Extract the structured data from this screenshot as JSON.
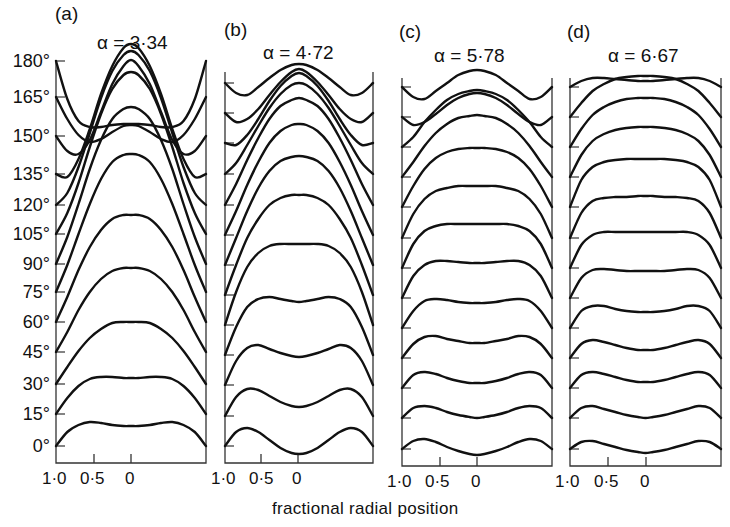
{
  "chart_data": {
    "type": "line",
    "title": "",
    "xlabel": "fractional radial position",
    "ylabel": "",
    "y_tick_labels": [
      "180°",
      "165°",
      "150°",
      "135°",
      "120°",
      "105°",
      "90°",
      "75°",
      "60°",
      "45°",
      "30°",
      "15°",
      "0°"
    ],
    "x_tick_labels": [
      "1·0",
      "0·5",
      "0"
    ],
    "grid": false,
    "legend": null,
    "panels": [
      {
        "letter": "(a)",
        "alpha_label": "α = 3·34",
        "alpha": 3.34,
        "x0": 56,
        "x1": 206,
        "top": 60,
        "bottom": 463,
        "xc": 131,
        "xh": 94,
        "baselines": [
          446,
          414,
          384,
          352,
          322,
          292,
          264,
          234,
          205,
          174,
          136,
          97,
          61
        ],
        "samples_x": [
          -1,
          -0.85,
          -0.7,
          -0.55,
          -0.4,
          -0.25,
          -0.1,
          0,
          0.1,
          0.25,
          0.4,
          0.55,
          0.7,
          0.85,
          1
        ],
        "curves": [
          [
            0,
            -14,
            -21,
            -24,
            -23,
            -21,
            -20,
            -20,
            -20,
            -21,
            -23,
            -24,
            -21,
            -14,
            0
          ],
          [
            0,
            -16,
            -28,
            -35,
            -37,
            -37,
            -36,
            -36,
            -36,
            -37,
            -37,
            -35,
            -28,
            -16,
            0
          ],
          [
            0,
            -17,
            -33,
            -46,
            -55,
            -61,
            -62,
            -62,
            -62,
            -61,
            -55,
            -46,
            -33,
            -17,
            0
          ],
          [
            0,
            -20,
            -42,
            -60,
            -73,
            -81,
            -84,
            -84,
            -84,
            -81,
            -73,
            -60,
            -42,
            -20,
            0
          ],
          [
            0,
            -25,
            -52,
            -75,
            -92,
            -103,
            -107,
            -107,
            -107,
            -103,
            -92,
            -75,
            -52,
            -25,
            0
          ],
          [
            0,
            -27,
            -58,
            -88,
            -113,
            -130,
            -137,
            -138,
            -137,
            -130,
            -113,
            -88,
            -58,
            -27,
            0
          ],
          [
            0,
            -27,
            -60,
            -95,
            -124,
            -145,
            -155,
            -157,
            -155,
            -145,
            -124,
            -95,
            -60,
            -27,
            0
          ],
          [
            0,
            -21,
            -51,
            -87,
            -120,
            -145,
            -159,
            -162,
            -159,
            -145,
            -120,
            -87,
            -51,
            -21,
            0
          ],
          [
            0,
            -12,
            -38,
            -72,
            -107,
            -134,
            -150,
            -154,
            -150,
            -134,
            -107,
            -72,
            -38,
            -12,
            0
          ],
          [
            0,
            3,
            -15,
            -45,
            -80,
            -108,
            -126,
            -130,
            -126,
            -108,
            -80,
            -45,
            -15,
            3,
            0
          ],
          [
            0,
            15,
            18,
            4,
            -24,
            -52,
            -70,
            -76,
            -70,
            -52,
            -24,
            4,
            18,
            15,
            0
          ],
          [
            0,
            22,
            38,
            45,
            42,
            35,
            29,
            28,
            29,
            35,
            42,
            45,
            38,
            22,
            0
          ],
          [
            0,
            38,
            60,
            66,
            66,
            64,
            63,
            63,
            63,
            64,
            66,
            66,
            60,
            38,
            0
          ]
        ]
      },
      {
        "letter": "(b)",
        "alpha_label": "α = 4·72",
        "alpha": 4.72,
        "x0": 225,
        "x1": 373,
        "top": 72,
        "bottom": 463,
        "xc": 298,
        "xh": 261,
        "baselines": [
          446,
          416,
          385,
          355,
          325,
          295,
          265,
          235,
          205,
          174,
          143,
          113,
          83
        ],
        "samples_x": [
          -1,
          -0.85,
          -0.7,
          -0.55,
          -0.4,
          -0.25,
          -0.1,
          0,
          0.1,
          0.25,
          0.4,
          0.55,
          0.7,
          0.85,
          1
        ],
        "curves": [
          [
            0,
            -14,
            -18,
            -14,
            -6,
            2,
            7,
            8,
            7,
            2,
            -6,
            -14,
            -18,
            -14,
            0
          ],
          [
            0,
            -19,
            -27,
            -26,
            -20,
            -14,
            -10,
            -9,
            -10,
            -14,
            -20,
            -26,
            -27,
            -19,
            0
          ],
          [
            0,
            -24,
            -37,
            -40,
            -36,
            -32,
            -29,
            -28,
            -29,
            -32,
            -36,
            -40,
            -37,
            -24,
            0
          ],
          [
            0,
            -28,
            -48,
            -56,
            -58,
            -56,
            -54,
            -53,
            -54,
            -56,
            -58,
            -56,
            -48,
            -28,
            0
          ],
          [
            0,
            -33,
            -58,
            -72,
            -79,
            -81,
            -81,
            -81,
            -81,
            -81,
            -79,
            -72,
            -58,
            -33,
            0
          ],
          [
            0,
            -30,
            -57,
            -76,
            -90,
            -97,
            -100,
            -100,
            -100,
            -97,
            -90,
            -76,
            -57,
            -30,
            0
          ],
          [
            0,
            -27,
            -54,
            -77,
            -94,
            -104,
            -108,
            -109,
            -108,
            -104,
            -94,
            -77,
            -54,
            -27,
            0
          ],
          [
            0,
            -24,
            -50,
            -73,
            -92,
            -104,
            -110,
            -111,
            -110,
            -104,
            -92,
            -73,
            -50,
            -24,
            0
          ],
          [
            0,
            -21,
            -45,
            -67,
            -86,
            -99,
            -105,
            -107,
            -105,
            -99,
            -86,
            -67,
            -45,
            -21,
            0
          ],
          [
            0,
            -11,
            -29,
            -48,
            -66,
            -80,
            -89,
            -91,
            -89,
            -80,
            -66,
            -48,
            -29,
            -11,
            0
          ],
          [
            0,
            2,
            -8,
            -24,
            -42,
            -57,
            -67,
            -70,
            -67,
            -57,
            -42,
            -24,
            -8,
            2,
            0
          ],
          [
            0,
            9,
            6,
            -4,
            -18,
            -31,
            -41,
            -44,
            -41,
            -31,
            -18,
            -4,
            6,
            9,
            0
          ],
          [
            0,
            10,
            12,
            4,
            -5,
            -13,
            -18,
            -19,
            -18,
            -13,
            -5,
            4,
            12,
            10,
            0
          ]
        ]
      },
      {
        "letter": "(c)",
        "alpha_label": "α = 5·78",
        "alpha": 5.78,
        "x0": 402,
        "x1": 552,
        "top": 78,
        "bottom": 466,
        "xc": 477,
        "xh": 440,
        "baselines": [
          449,
          418,
          388,
          358,
          328,
          298,
          268,
          238,
          207,
          177,
          147,
          117,
          87
        ],
        "samples_x": [
          -1,
          -0.85,
          -0.7,
          -0.55,
          -0.4,
          -0.25,
          -0.1,
          0,
          0.1,
          0.25,
          0.4,
          0.55,
          0.7,
          0.85,
          1
        ],
        "curves": [
          [
            0,
            -8,
            -10,
            -7,
            -2,
            2,
            5,
            6,
            5,
            2,
            -2,
            -7,
            -10,
            -8,
            0
          ],
          [
            0,
            -10,
            -12,
            -10,
            -6,
            -3,
            -1,
            0,
            -1,
            -3,
            -6,
            -10,
            -12,
            -10,
            0
          ],
          [
            0,
            -13,
            -16,
            -14,
            -10,
            -7,
            -5,
            -5,
            -5,
            -7,
            -10,
            -14,
            -16,
            -13,
            0
          ],
          [
            0,
            -14,
            -21,
            -22,
            -19,
            -17,
            -15,
            -15,
            -15,
            -17,
            -19,
            -22,
            -21,
            -14,
            0
          ],
          [
            0,
            -17,
            -27,
            -29,
            -28,
            -26,
            -25,
            -25,
            -25,
            -26,
            -28,
            -29,
            -27,
            -17,
            0
          ],
          [
            0,
            -22,
            -33,
            -37,
            -37,
            -36,
            -35,
            -35,
            -35,
            -36,
            -37,
            -37,
            -33,
            -22,
            0
          ],
          [
            0,
            -24,
            -37,
            -42,
            -44,
            -44,
            -44,
            -44,
            -44,
            -44,
            -44,
            -42,
            -37,
            -24,
            0
          ],
          [
            0,
            -24,
            -39,
            -47,
            -50,
            -52,
            -52,
            -52,
            -52,
            -52,
            -50,
            -47,
            -39,
            -24,
            0
          ],
          [
            0,
            -21,
            -38,
            -49,
            -55,
            -58,
            -59,
            -59,
            -59,
            -58,
            -55,
            -49,
            -38,
            -21,
            0
          ],
          [
            0,
            -15,
            -31,
            -44,
            -53,
            -59,
            -61,
            -62,
            -61,
            -59,
            -53,
            -44,
            -31,
            -15,
            0
          ],
          [
            0,
            -10,
            -25,
            -37,
            -47,
            -53,
            -56,
            -57,
            -56,
            -53,
            -47,
            -37,
            -25,
            -10,
            0
          ],
          [
            0,
            8,
            5,
            -3,
            -12,
            -19,
            -23,
            -24,
            -23,
            -19,
            -12,
            -3,
            5,
            8,
            0
          ],
          [
            0,
            10,
            12,
            4,
            -4,
            -12,
            -16,
            -17,
            -16,
            -12,
            -4,
            4,
            12,
            10,
            0
          ]
        ]
      },
      {
        "letter": "(d)",
        "alpha_label": "α = 6·67",
        "alpha": 6.67,
        "x0": 570,
        "x1": 721,
        "top": 78,
        "bottom": 466,
        "xc": 646,
        "xh": 608,
        "baselines": [
          449,
          418,
          388,
          358,
          328,
          298,
          268,
          238,
          207,
          177,
          147,
          117,
          87
        ],
        "samples_x": [
          -1,
          -0.85,
          -0.7,
          -0.55,
          -0.4,
          -0.25,
          -0.1,
          0,
          0.1,
          0.25,
          0.4,
          0.55,
          0.7,
          0.85,
          1
        ],
        "curves": [
          [
            0,
            -7,
            -8,
            -5,
            -2,
            1,
            3,
            4,
            3,
            1,
            -2,
            -5,
            -8,
            -7,
            0
          ],
          [
            0,
            -10,
            -12,
            -9,
            -6,
            -3,
            -1,
            0,
            -1,
            -3,
            -6,
            -9,
            -12,
            -10,
            0
          ],
          [
            0,
            -13,
            -16,
            -14,
            -11,
            -8,
            -6,
            -6,
            -6,
            -8,
            -11,
            -14,
            -16,
            -13,
            0
          ],
          [
            0,
            -14,
            -18,
            -16,
            -13,
            -10,
            -8,
            -8,
            -8,
            -10,
            -13,
            -16,
            -18,
            -14,
            0
          ],
          [
            0,
            -17,
            -22,
            -22,
            -19,
            -17,
            -16,
            -16,
            -16,
            -17,
            -19,
            -22,
            -22,
            -17,
            0
          ],
          [
            0,
            -20,
            -28,
            -29,
            -28,
            -27,
            -27,
            -27,
            -27,
            -27,
            -28,
            -29,
            -28,
            -20,
            0
          ],
          [
            0,
            -23,
            -33,
            -36,
            -36,
            -36,
            -36,
            -36,
            -36,
            -36,
            -36,
            -36,
            -33,
            -23,
            0
          ],
          [
            0,
            -25,
            -37,
            -40,
            -41,
            -41,
            -42,
            -42,
            -42,
            -41,
            -41,
            -40,
            -37,
            -25,
            0
          ],
          [
            0,
            -27,
            -40,
            -45,
            -47,
            -48,
            -48,
            -48,
            -48,
            -48,
            -47,
            -45,
            -40,
            -27,
            0
          ],
          [
            0,
            -22,
            -36,
            -43,
            -47,
            -49,
            -50,
            -50,
            -50,
            -49,
            -47,
            -43,
            -36,
            -22,
            0
          ],
          [
            0,
            -18,
            -32,
            -40,
            -45,
            -48,
            -49,
            -49,
            -49,
            -48,
            -45,
            -40,
            -32,
            -18,
            0
          ],
          [
            0,
            -14,
            -26,
            -33,
            -38,
            -40,
            -41,
            -41,
            -41,
            -40,
            -38,
            -33,
            -26,
            -14,
            0
          ],
          [
            0,
            -6,
            -9,
            -9,
            -8,
            -7,
            -6,
            -6,
            -6,
            -7,
            -8,
            -9,
            -9,
            -6,
            0
          ]
        ]
      }
    ],
    "y_label_positions": [
      61,
      97,
      136,
      174,
      205,
      234,
      264,
      292,
      322,
      352,
      384,
      414,
      446
    ]
  }
}
